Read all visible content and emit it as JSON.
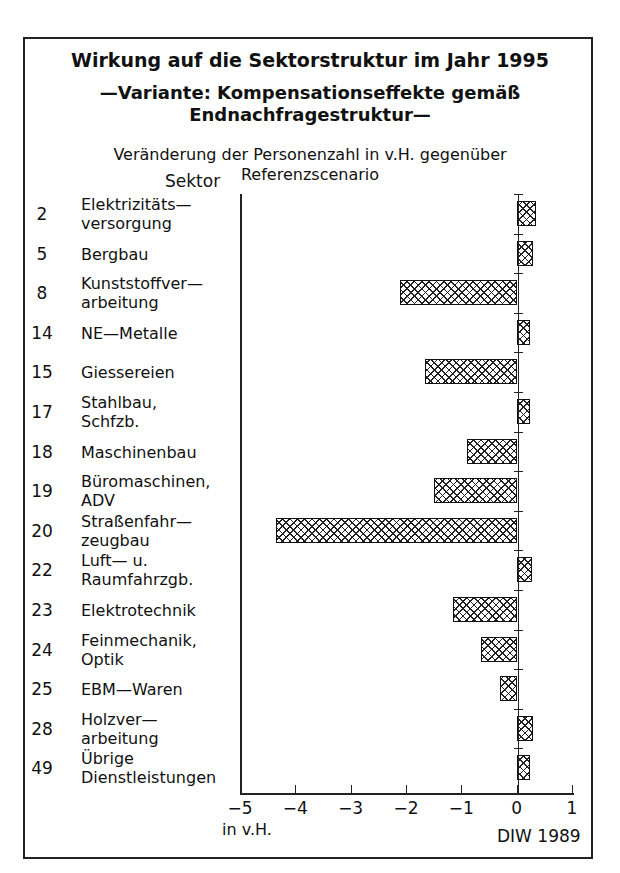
{
  "header": {
    "title_line1": "Wirkung auf die Sektorstruktur im Jahr 1995",
    "title_line2": "—Variante: Kompensationseffekte gemäß",
    "title_line3": "Endnachfragestruktur—",
    "subtitle_line1": "Veränderung der Personenzahl in v.H. gegenüber",
    "subtitle_line2": "Referenzscenario",
    "sektor_heading": "Sektor"
  },
  "footer": {
    "unit_label": "in v.H.",
    "credit": "DIW 1989"
  },
  "chart_data": {
    "type": "bar",
    "orientation": "horizontal",
    "subtitle": "Veränderung der Personenzahl in v.H. gegenüber Referenzscenario",
    "xlabel": "in v.H.",
    "ylabel": "Sektor",
    "xlim": [
      -5,
      1
    ],
    "xticks": [
      "−5",
      "−4",
      "−3",
      "−2",
      "−1",
      "0",
      "1"
    ],
    "grid": false,
    "legend": null,
    "source": "DIW 1989",
    "categories": [
      {
        "code": "2",
        "label": "Elektrizitäts—\nversorgung"
      },
      {
        "code": "5",
        "label": "Bergbau"
      },
      {
        "code": "8",
        "label": "Kunststoffver—\narbeitung"
      },
      {
        "code": "14",
        "label": "NE—Metalle"
      },
      {
        "code": "15",
        "label": "Giessereien"
      },
      {
        "code": "17",
        "label": "Stahlbau,\nSchfzb."
      },
      {
        "code": "18",
        "label": "Maschinenbau"
      },
      {
        "code": "19",
        "label": "Büromaschinen,\nADV"
      },
      {
        "code": "20",
        "label": "Straßenfahr—\nzeugbau"
      },
      {
        "code": "22",
        "label": "Luft— u.\nRaumfahrzgb."
      },
      {
        "code": "23",
        "label": "Elektrotechnik"
      },
      {
        "code": "24",
        "label": "Feinmechanik,\nOptik"
      },
      {
        "code": "25",
        "label": "EBM—Waren"
      },
      {
        "code": "28",
        "label": "Holzver—\narbeitung"
      },
      {
        "code": "49",
        "label": "Übrige\nDienstleistungen"
      }
    ],
    "values": [
      0.35,
      0.3,
      -2.1,
      0.25,
      -1.65,
      0.25,
      -0.9,
      -1.5,
      -4.35,
      0.27,
      -1.15,
      -0.65,
      -0.3,
      0.3,
      0.25
    ]
  }
}
